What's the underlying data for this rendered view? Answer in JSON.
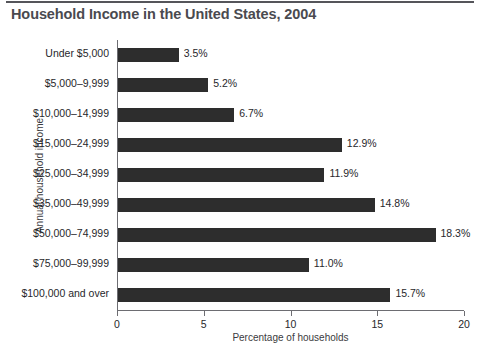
{
  "chart_data": {
    "type": "bar",
    "orientation": "horizontal",
    "title": "Household Income in the United States, 2004",
    "xlabel": "Percentage of households",
    "ylabel": "Annual household income",
    "xlim": [
      0,
      20
    ],
    "xticks": [
      0,
      5,
      10,
      15,
      20
    ],
    "xtick_labels": [
      "0",
      "5",
      "10",
      "15",
      "20"
    ],
    "grid": false,
    "legend": false,
    "bar_color": "#2d2d2d",
    "categories": [
      "Under $5,000",
      "$5,000–9,999",
      "$10,000–14,999",
      "$15,000–24,999",
      "$25,000–34,999",
      "$35,000–49,999",
      "$50,000–74,999",
      "$75,000–99,999",
      "$100,000 and over"
    ],
    "values": [
      3.5,
      5.2,
      6.7,
      12.9,
      11.9,
      14.8,
      18.3,
      11.0,
      15.7
    ],
    "value_labels": [
      "3.5%",
      "5.2%",
      "6.7%",
      "12.9%",
      "11.9%",
      "14.8%",
      "18.3%",
      "11.0%",
      "15.7%"
    ]
  }
}
